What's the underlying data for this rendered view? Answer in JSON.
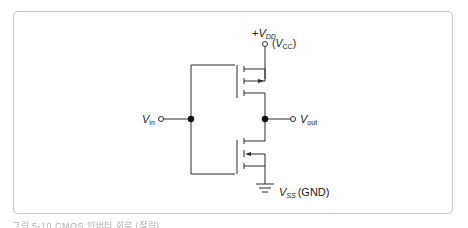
{
  "diagram": {
    "type": "CMOS inverter",
    "labels": {
      "vdd_prefix": "+",
      "vdd_main": "V",
      "vdd_sub": "DD",
      "vcc_open": "(",
      "vcc_main": "V",
      "vcc_sub": "CC",
      "vcc_close": ")",
      "vin_main": "V",
      "vin_sub": "in",
      "vout_main": "V",
      "vout_sub": "out",
      "vss_main": "V",
      "vss_sub": "SS",
      "gnd": "(GND)"
    },
    "components": [
      {
        "name": "PMOS transistor",
        "position": "top",
        "arrow": "toward channel"
      },
      {
        "name": "NMOS transistor",
        "position": "bottom",
        "arrow": "away from channel"
      }
    ],
    "colors": {
      "line": "#2a2a2a",
      "frame": "#c8c8c8"
    }
  },
  "caption": {
    "text": "그림 5-10  CMOS 인버터 회로 (잘림)"
  }
}
